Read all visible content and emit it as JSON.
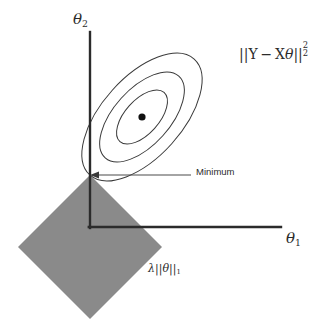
{
  "figure": {
    "type": "lasso-regression-geometry-diagram",
    "background_color": "#ffffff",
    "stroke_color": "#2b2b2b",
    "contour_color": "#3a3a3a",
    "constraint_fill_color": "#8a8a8a"
  },
  "axes": {
    "y_axis_label": "θ₂",
    "x_axis_label": "θ₁",
    "origin": {
      "x": 90,
      "y": 227
    },
    "y_axis_top": {
      "x": 90,
      "y": 32
    },
    "x_axis_right": {
      "x": 281,
      "y": 227
    }
  },
  "contours": {
    "label": "||Y − Xθ||",
    "label_superscript": "2",
    "label_subscript": "2",
    "center": {
      "x": 142,
      "y": 117
    },
    "rotation_deg": -48,
    "count": 3,
    "levels": [
      {
        "rx": 78,
        "ry": 40
      },
      {
        "rx": 55,
        "ry": 28
      },
      {
        "rx": 33,
        "ry": 17
      }
    ],
    "center_dot_radius": 3.6
  },
  "constraint": {
    "label": "λ||θ||",
    "label_subscript": "1",
    "shape": "diamond",
    "center": {
      "x": 90,
      "y": 247
    },
    "half_diagonal_x": 72,
    "half_diagonal_y": 72,
    "fill": "#8a8a8a"
  },
  "annotation": {
    "minimum_label": "Minimum",
    "arrow_tip": {
      "x": 91,
      "y": 175
    },
    "arrow_tail": {
      "x": 191,
      "y": 175
    }
  },
  "solution_point": {
    "name": "tangency-point",
    "x": 90,
    "y": 175
  }
}
